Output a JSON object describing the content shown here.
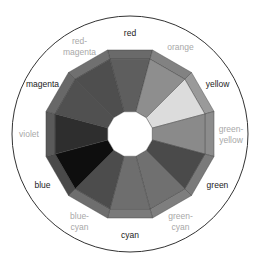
{
  "diagram": {
    "title": "",
    "center": [
      130,
      134
    ],
    "circle_radius": 118,
    "outer_radius": 87,
    "band_inner_radius": 77.5,
    "hole_radius": 23,
    "label_radius": 101,
    "primary_label_color": "#222222",
    "tertiary_label_color": "#a8a8a8",
    "circle_stroke": "#333333",
    "hole_fill": "#ffffff",
    "segments": [
      {
        "name": "red",
        "label_lines": [
          "red"
        ],
        "tier": "primary",
        "angle": 0,
        "inner_fill": "#5e5e5e",
        "band_fill": "#6a6a6a"
      },
      {
        "name": "orange",
        "label_lines": [
          "orange"
        ],
        "tier": "tertiary",
        "angle": 30,
        "inner_fill": "#8e8e8e",
        "band_fill": "#828282"
      },
      {
        "name": "yellow",
        "label_lines": [
          "yellow"
        ],
        "tier": "primary",
        "angle": 60,
        "inner_fill": "#dcdcdc",
        "band_fill": "#9a9a9a"
      },
      {
        "name": "green-yellow",
        "label_lines": [
          "green-",
          "yellow"
        ],
        "tier": "tertiary",
        "angle": 90,
        "inner_fill": "#8a8a8a",
        "band_fill": "#8c8c8c"
      },
      {
        "name": "green",
        "label_lines": [
          "green"
        ],
        "tier": "primary",
        "angle": 120,
        "inner_fill": "#4a4a4a",
        "band_fill": "#7a7a7a"
      },
      {
        "name": "green-cyan",
        "label_lines": [
          "green-",
          "cyan"
        ],
        "tier": "tertiary",
        "angle": 150,
        "inner_fill": "#707070",
        "band_fill": "#7e7e7e"
      },
      {
        "name": "cyan",
        "label_lines": [
          "cyan"
        ],
        "tier": "primary",
        "angle": 180,
        "inner_fill": "#6e6e6e",
        "band_fill": "#7a7a7a"
      },
      {
        "name": "blue-cyan",
        "label_lines": [
          "blue-",
          "cyan"
        ],
        "tier": "tertiary",
        "angle": 210,
        "inner_fill": "#4c4c4c",
        "band_fill": "#6e6e6e"
      },
      {
        "name": "blue",
        "label_lines": [
          "blue"
        ],
        "tier": "primary",
        "angle": 240,
        "inner_fill": "#0e0e0e",
        "band_fill": "#4a4a4a"
      },
      {
        "name": "violet",
        "label_lines": [
          "violet"
        ],
        "tier": "tertiary",
        "angle": 270,
        "inner_fill": "#2e2e2e",
        "band_fill": "#5a5a5a"
      },
      {
        "name": "magenta",
        "label_lines": [
          "magenta"
        ],
        "tier": "primary",
        "angle": 300,
        "inner_fill": "#505050",
        "band_fill": "#686868"
      },
      {
        "name": "red-magenta",
        "label_lines": [
          "red-",
          "magenta"
        ],
        "tier": "tertiary",
        "angle": 330,
        "inner_fill": "#4e4e4e",
        "band_fill": "#707070"
      }
    ]
  }
}
